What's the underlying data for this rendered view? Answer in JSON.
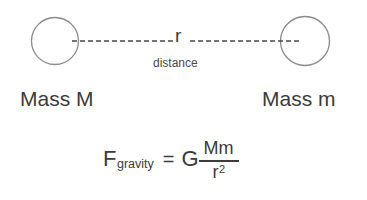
{
  "diagram": {
    "stroke_color": "#8a8a8a",
    "text_color": "#3b3b3b",
    "background_color": "#ffffff",
    "left_mass_label": "Mass M",
    "right_mass_label": "Mass m",
    "separation_symbol": "r",
    "separation_caption": "distance",
    "left_circle": {
      "cx": 55,
      "cy": 41,
      "r": 23.5
    },
    "right_circle": {
      "cx": 305,
      "cy": 41,
      "r": 24.5
    },
    "dash_line": {
      "left_segment": {
        "x1": 72,
        "x2": 173,
        "y": 41
      },
      "right_segment": {
        "x1": 190,
        "x2": 301,
        "y": 41
      },
      "dash_pattern": "5,3",
      "stroke_width": 1.6
    }
  },
  "formula": {
    "force_symbol": "F",
    "force_subscript": "gravity",
    "equals": "=",
    "constant": "G",
    "numerator": "Mm",
    "denominator_base": "r",
    "denominator_exponent": "2",
    "plain_text": "F_gravity = G Mm / r^2"
  }
}
